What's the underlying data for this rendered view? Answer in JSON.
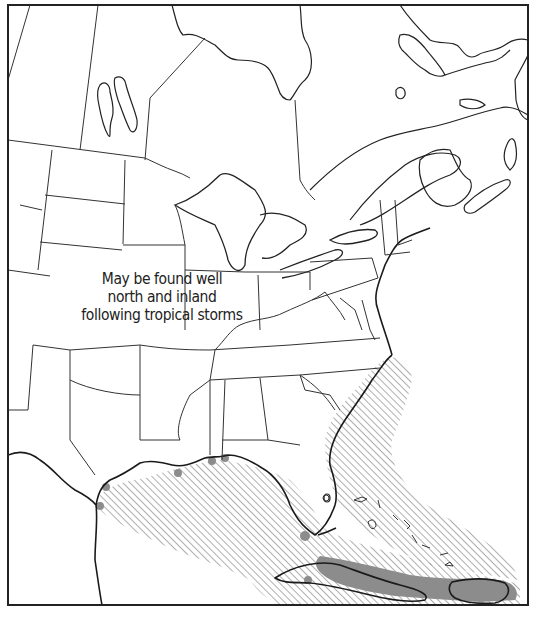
{
  "map": {
    "title": "",
    "region": "Eastern North America, Gulf of Mexico and Caribbean",
    "frame": {
      "x": 8,
      "y": 5,
      "width": 520,
      "height": 600
    },
    "colors": {
      "background": "#ffffff",
      "border": "#222222",
      "state_lines": "#333333",
      "coastline": "#1a1a1a",
      "hatch": "#9a9a9a",
      "solid_range": "#8c8c8c"
    },
    "annotation": {
      "lines": [
        "May be found well",
        "north and inland",
        "following tropical storms"
      ]
    },
    "legend": {
      "hatched": "range (hatched area)",
      "solid": "range (solid gray area)"
    }
  }
}
